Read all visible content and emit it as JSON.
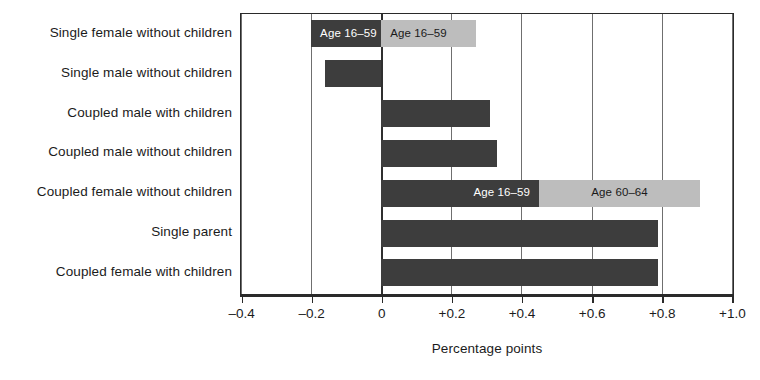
{
  "chart_data": {
    "type": "bar",
    "orientation": "horizontal",
    "stacked": true,
    "title": "",
    "xlabel": "Percentage points",
    "ylabel": "",
    "xlim": [
      -0.4,
      1.0
    ],
    "xticks": [
      -0.4,
      -0.2,
      0,
      0.2,
      0.4,
      0.6,
      0.8,
      1.0
    ],
    "xtick_labels": [
      "–0.4",
      "–0.2",
      "0",
      "+0.2",
      "+0.4",
      "+0.6",
      "+0.8",
      "+1.0"
    ],
    "grid": true,
    "legend_position": "inline-data-labels",
    "categories": [
      "Single female without children",
      "Single male without children",
      "Coupled male with children",
      "Coupled male without children",
      "Coupled female without children",
      "Single parent",
      "Coupled female with children"
    ],
    "series": [
      {
        "name": "Age 16–59",
        "color": "#3d3d3d",
        "values": [
          -0.2,
          -0.16,
          0.31,
          0.33,
          0.45,
          0.79,
          0.79
        ]
      },
      {
        "name": "Age 60–64",
        "color": "#bdbdbd",
        "values": [
          0.27,
          null,
          null,
          null,
          0.46,
          null,
          null
        ]
      }
    ],
    "annotations": [
      {
        "row": 0,
        "series": "Age 16–59",
        "text": "Age 16–59"
      },
      {
        "row": 0,
        "series": "Age 60–64",
        "text": "Age 16–59"
      },
      {
        "row": 4,
        "series": "Age 16–59",
        "text": "Age 16–59"
      },
      {
        "row": 4,
        "series": "Age 60–64",
        "text": "Age 60–64"
      }
    ]
  },
  "axis": {
    "x_title": "Percentage points",
    "ticks": [
      {
        "value": -0.4,
        "label": "–0.4"
      },
      {
        "value": -0.2,
        "label": "–0.2"
      },
      {
        "value": 0,
        "label": "0"
      },
      {
        "value": 0.2,
        "label": "+0.2"
      },
      {
        "value": 0.4,
        "label": "+0.4"
      },
      {
        "value": 0.6,
        "label": "+0.6"
      },
      {
        "value": 0.8,
        "label": "+0.8"
      },
      {
        "value": 1.0,
        "label": "+1.0"
      }
    ]
  },
  "categories": [
    {
      "label": "Single female without children"
    },
    {
      "label": "Single male without children"
    },
    {
      "label": "Coupled male with children"
    },
    {
      "label": "Coupled male without children"
    },
    {
      "label": "Coupled female without children"
    },
    {
      "label": "Single parent"
    },
    {
      "label": "Coupled female with children"
    }
  ],
  "bars": [
    {
      "row": 0,
      "segments": [
        {
          "series": "Age 16–59",
          "from": -0.2,
          "to": 0.0,
          "tone": "dark",
          "label": "Age 16–59",
          "label_pos": "left"
        },
        {
          "series": "Age 60–64",
          "from": 0.0,
          "to": 0.27,
          "tone": "light",
          "label": "Age 16–59",
          "label_pos": "left"
        }
      ]
    },
    {
      "row": 1,
      "segments": [
        {
          "series": "Age 16–59",
          "from": -0.16,
          "to": 0.0,
          "tone": "dark",
          "label": "",
          "label_pos": "left"
        }
      ]
    },
    {
      "row": 2,
      "segments": [
        {
          "series": "Age 16–59",
          "from": 0.0,
          "to": 0.31,
          "tone": "dark",
          "label": "",
          "label_pos": "left"
        }
      ]
    },
    {
      "row": 3,
      "segments": [
        {
          "series": "Age 16–59",
          "from": 0.0,
          "to": 0.33,
          "tone": "dark",
          "label": "",
          "label_pos": "left"
        }
      ]
    },
    {
      "row": 4,
      "segments": [
        {
          "series": "Age 16–59",
          "from": 0.0,
          "to": 0.45,
          "tone": "dark",
          "label": "Age 16–59",
          "label_pos": "right"
        },
        {
          "series": "Age 60–64",
          "from": 0.45,
          "to": 0.91,
          "tone": "light",
          "label": "Age 60–64",
          "label_pos": "center"
        }
      ]
    },
    {
      "row": 5,
      "segments": [
        {
          "series": "Age 16–59",
          "from": 0.0,
          "to": 0.79,
          "tone": "dark",
          "label": "",
          "label_pos": "left"
        }
      ]
    },
    {
      "row": 6,
      "segments": [
        {
          "series": "Age 16–59",
          "from": 0.0,
          "to": 0.79,
          "tone": "dark",
          "label": "",
          "label_pos": "left"
        }
      ]
    }
  ]
}
